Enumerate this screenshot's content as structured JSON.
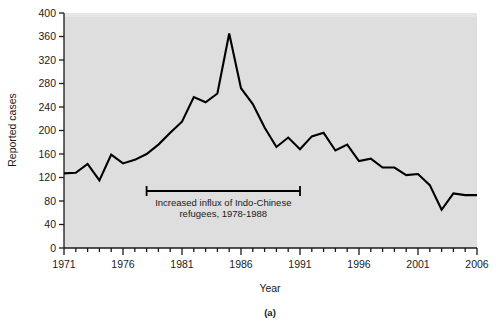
{
  "figure": {
    "panel_label": "(a)",
    "background_color": "#ffffff",
    "plot_background_color": "#dedede",
    "line_color": "#000000",
    "axis_color": "#1a1a1a"
  },
  "chart_data": {
    "type": "line",
    "title": "",
    "xlabel": "Year",
    "ylabel": "Reported cases",
    "xlim": [
      1971,
      2006
    ],
    "ylim": [
      0,
      400
    ],
    "grid": false,
    "legend": null,
    "x_ticks_major": [
      1971,
      1976,
      1981,
      1986,
      1991,
      1996,
      2001,
      2006
    ],
    "x_tick_labels": [
      "1971",
      "1976",
      "1981",
      "1986",
      "1991",
      "1996",
      "2001",
      "2006"
    ],
    "x_minor_tick_step": 1,
    "y_ticks": [
      0,
      40,
      80,
      120,
      160,
      200,
      240,
      280,
      320,
      360,
      400
    ],
    "y_tick_labels": [
      "0",
      "40",
      "80",
      "120",
      "160",
      "200",
      "240",
      "280",
      "320",
      "360",
      "400"
    ],
    "x": [
      1971,
      1972,
      1973,
      1974,
      1975,
      1976,
      1977,
      1978,
      1979,
      1980,
      1981,
      1982,
      1983,
      1984,
      1985,
      1986,
      1987,
      1988,
      1989,
      1990,
      1991,
      1992,
      1993,
      1994,
      1995,
      1996,
      1997,
      1998,
      1999,
      2000,
      2001,
      2002,
      2003,
      2004,
      2005,
      2006
    ],
    "values": [
      127,
      128,
      143,
      115,
      159,
      144,
      150,
      160,
      176,
      196,
      215,
      257,
      248,
      263,
      365,
      272,
      245,
      205,
      172,
      188,
      168,
      190,
      196,
      166,
      176,
      148,
      152,
      137,
      137,
      124,
      126,
      107,
      65,
      93,
      90,
      90
    ],
    "annotations": [
      {
        "name": "refugee-influx-bracket",
        "text_line_1": "Increased influx of Indo-Chinese",
        "text_line_2": "refugees, 1978-1988",
        "x_start": 1978,
        "x_end": 1991,
        "y": 97
      }
    ]
  }
}
